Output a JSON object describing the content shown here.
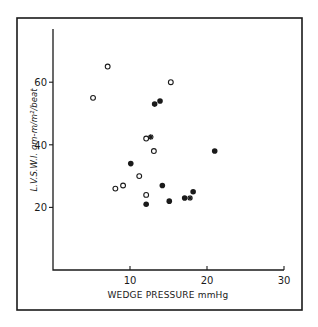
{
  "chart_data": {
    "type": "scatter",
    "title": "",
    "xlabel": "WEDGE PRESSURE mmHg",
    "ylabel": "LVSWI gm-m/m²/beat",
    "ylabel_display": "L.V.S.W.I.  gm-m/m²/beat",
    "xlim": [
      0,
      30
    ],
    "ylim": [
      0,
      70
    ],
    "x_ticks": [
      10,
      20,
      30
    ],
    "y_ticks": [
      20,
      40,
      60
    ],
    "grid": false,
    "legend": null,
    "series": [
      {
        "name": "open circles",
        "marker": "open-circle",
        "points": [
          {
            "x": 7.1,
            "y": 65
          },
          {
            "x": 15.3,
            "y": 60
          },
          {
            "x": 5.2,
            "y": 55
          },
          {
            "x": 12.1,
            "y": 42
          },
          {
            "x": 13.1,
            "y": 38
          },
          {
            "x": 11.2,
            "y": 30
          },
          {
            "x": 9.1,
            "y": 27
          },
          {
            "x": 8.1,
            "y": 26
          },
          {
            "x": 12.1,
            "y": 24
          }
        ]
      },
      {
        "name": "filled circles",
        "marker": "filled-circle",
        "points": [
          {
            "x": 13.2,
            "y": 53
          },
          {
            "x": 13.9,
            "y": 54
          },
          {
            "x": 21.0,
            "y": 38
          },
          {
            "x": 10.1,
            "y": 34
          },
          {
            "x": 14.2,
            "y": 27
          },
          {
            "x": 18.2,
            "y": 25
          },
          {
            "x": 17.1,
            "y": 23
          },
          {
            "x": 15.1,
            "y": 22
          },
          {
            "x": 12.1,
            "y": 21
          }
        ]
      },
      {
        "name": "stars",
        "marker": "star",
        "points": [
          {
            "x": 12.7,
            "y": 42.5
          },
          {
            "x": 17.8,
            "y": 23
          }
        ]
      }
    ]
  },
  "colors": {
    "ink": "#1a1a1a",
    "background": "#ffffff"
  }
}
